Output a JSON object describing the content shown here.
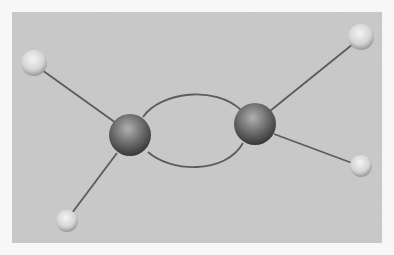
{
  "image": {
    "subject": "molecular model",
    "description": "Ball-and-stick model with two large dark spheres joined by two curved bonds, each bonded to two small light spheres",
    "colors": {
      "border": "#f7f7f7",
      "background": "#c9c9c9",
      "large_sphere": "#5a5a5a",
      "small_sphere": "#dcdcdc",
      "bond": "#5c5c5c"
    }
  }
}
